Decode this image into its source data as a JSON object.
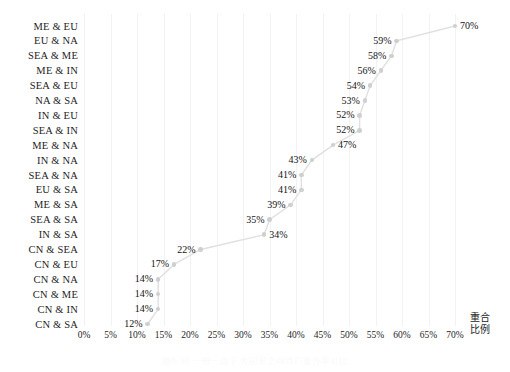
{
  "chart_data": {
    "type": "line",
    "title": "",
    "subtitle": "",
    "xlabel": "重合比例",
    "xlabel_line1": "重合",
    "xlabel_line2": "比例",
    "ylabel": "",
    "orientation": "horizontal-categories",
    "grid": "vertical-only",
    "legend": "none",
    "xlim": [
      0,
      70
    ],
    "xtick_labels": [
      "0%",
      "5%",
      "10%",
      "15%",
      "20%",
      "25%",
      "30%",
      "35%",
      "40%",
      "45%",
      "50%",
      "55%",
      "60%",
      "65%",
      "70%"
    ],
    "xticks": [
      0,
      5,
      10,
      15,
      20,
      25,
      30,
      35,
      40,
      45,
      50,
      55,
      60,
      65,
      70
    ],
    "categories": [
      "ME & EU",
      "EU & NA",
      "SEA & ME",
      "ME & IN",
      "SEA & EU",
      "NA & SA",
      "IN & EU",
      "SEA & IN",
      "ME & NA",
      "IN & NA",
      "SEA & NA",
      "EU & SA",
      "ME & SA",
      "SEA & SA",
      "IN & SA",
      "CN & SEA",
      "CN & EU",
      "CN & NA",
      "CN & ME",
      "CN & IN",
      "CN & SA"
    ],
    "values": [
      70,
      59,
      58,
      56,
      54,
      53,
      52,
      52,
      47,
      43,
      41,
      41,
      39,
      35,
      34,
      22,
      17,
      14,
      14,
      14,
      12
    ],
    "data_labels": [
      "70%",
      "59%",
      "58%",
      "56%",
      "54%",
      "53%",
      "52%",
      "52%",
      "47%",
      "43%",
      "41%",
      "41%",
      "39%",
      "35%",
      "34%",
      "22%",
      "17%",
      "14%",
      "14%",
      "14%",
      "12%"
    ],
    "label_side": [
      "right",
      "left",
      "left",
      "left",
      "left",
      "left",
      "left",
      "left",
      "right",
      "left",
      "left",
      "left",
      "left",
      "left",
      "right",
      "left",
      "left",
      "left",
      "left",
      "left",
      "left"
    ],
    "marker_color": "#cfcfcf",
    "line_color": "#e0e0e0",
    "grid_color": "#f2f2f2",
    "text_color": "#1d1d1d",
    "background_color": "#ffffff"
  },
  "caption": {
    "text": "图4-30 一带一路下 各国家之间用户重合率对比"
  }
}
